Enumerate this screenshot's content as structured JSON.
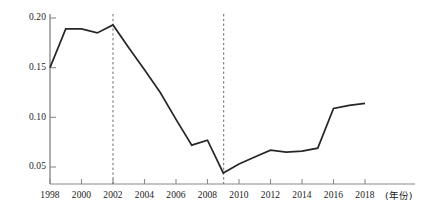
{
  "chart_data": {
    "type": "line",
    "title": "",
    "subtitle": "",
    "xlabel": "(年份)",
    "ylabel": "",
    "xlim": [
      1998,
      2018
    ],
    "ylim": [
      0.035,
      0.205
    ],
    "grid": false,
    "legend_position": "none",
    "x": [
      1998,
      1999,
      2000,
      2001,
      2002,
      2003,
      2004,
      2005,
      2006,
      2007,
      2008,
      2009,
      2010,
      2011,
      2012,
      2013,
      2014,
      2015,
      2016,
      2017,
      2018
    ],
    "values": [
      0.15,
      0.189,
      0.189,
      0.185,
      0.193,
      0.17,
      0.148,
      0.125,
      0.098,
      0.072,
      0.077,
      0.044,
      0.053,
      0.06,
      0.067,
      0.065,
      0.066,
      0.069,
      0.109,
      0.112,
      0.114
    ],
    "series": [
      {
        "name": "series-1",
        "color": "#262626",
        "values": [
          0.15,
          0.189,
          0.189,
          0.185,
          0.193,
          0.17,
          0.148,
          0.125,
          0.098,
          0.072,
          0.077,
          0.044,
          0.053,
          0.06,
          0.067,
          0.065,
          0.066,
          0.069,
          0.109,
          0.112,
          0.114
        ]
      }
    ],
    "x_ticks": [
      1998,
      2000,
      2002,
      2004,
      2006,
      2008,
      2010,
      2012,
      2014,
      2016,
      2018
    ],
    "x_tick_labels": [
      "1998",
      "2000",
      "2002",
      "2004",
      "2006",
      "2008",
      "2010",
      "2012",
      "2014",
      "2016",
      "2018"
    ],
    "y_ticks": [
      0.05,
      0.1,
      0.15,
      0.2
    ],
    "y_tick_labels": [
      "0.05",
      "0.10",
      "0.15",
      "0.20"
    ],
    "annotations": [
      {
        "type": "vline",
        "x": 2002,
        "style": "dashed",
        "color": "#6b6b6b"
      },
      {
        "type": "vline",
        "x": 2009,
        "style": "dashed",
        "color": "#6b6b6b"
      }
    ],
    "colors": {
      "line": "#262626",
      "axis": "#8a8a8a",
      "vline": "#6b6b6b",
      "background": "#ffffff"
    }
  },
  "axis": {
    "x_caption": "(年份)"
  },
  "y_labels": {
    "t0": "0.05",
    "t1": "0.10",
    "t2": "0.15",
    "t3": "0.20"
  },
  "x_labels": {
    "t0": "1998",
    "t1": "2000",
    "t2": "2002",
    "t3": "2004",
    "t4": "2006",
    "t5": "2008",
    "t6": "2010",
    "t7": "2012",
    "t8": "2014",
    "t9": "2016",
    "t10": "2018"
  }
}
